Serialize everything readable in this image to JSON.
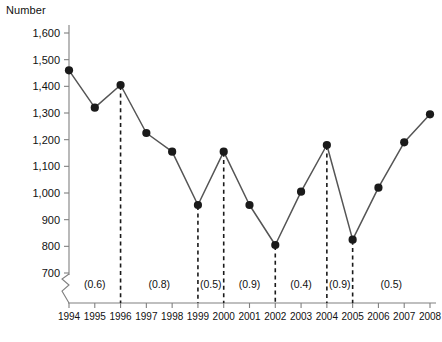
{
  "chart_data": {
    "type": "line",
    "title": "",
    "ylabel": "Number",
    "xlabel": "",
    "grid": false,
    "legend": null,
    "ylim": [
      700,
      1600
    ],
    "y_axis_break": true,
    "yticks": [
      "700",
      "800",
      "900",
      "1,000",
      "1,100",
      "1,200",
      "1,300",
      "1,400",
      "1,500",
      "1,600"
    ],
    "ytick_values": [
      700,
      800,
      900,
      1000,
      1100,
      1200,
      1300,
      1400,
      1500,
      1600
    ],
    "categories": [
      "1994",
      "1995",
      "1996",
      "1997",
      "1998",
      "1999",
      "2000",
      "2001",
      "2002",
      "2003",
      "2004",
      "2005",
      "2006",
      "2007",
      "2008"
    ],
    "x": [
      1994,
      1995,
      1996,
      1997,
      1998,
      1999,
      2000,
      2001,
      2002,
      2003,
      2004,
      2005,
      2006,
      2007,
      2008
    ],
    "values": [
      1460,
      1320,
      1405,
      1225,
      1155,
      955,
      1155,
      955,
      805,
      1005,
      1180,
      825,
      1020,
      1190,
      1295
    ],
    "series": [
      {
        "name": "Number",
        "values": [
          1460,
          1320,
          1405,
          1225,
          1155,
          955,
          1155,
          955,
          805,
          1005,
          1180,
          825,
          1020,
          1190,
          1295
        ]
      }
    ],
    "annotations": [
      {
        "label": "(0.6)",
        "between": [
          "1994",
          "1996"
        ],
        "center_x": 1995.0
      },
      {
        "label": "(0.8)",
        "between": [
          "1996",
          "1999"
        ],
        "center_x": 1997.5
      },
      {
        "label": "(0.5)",
        "between": [
          "1999",
          "2000"
        ],
        "center_x": 1999.5
      },
      {
        "label": "(0.9)",
        "between": [
          "2000",
          "2002"
        ],
        "center_x": 2001.0
      },
      {
        "label": "(0.4)",
        "between": [
          "2002",
          "2004"
        ],
        "center_x": 2003.0
      },
      {
        "label": "(0.9)",
        "between": [
          "2004",
          "2005"
        ],
        "center_x": 2004.5
      },
      {
        "label": "(0.5)",
        "between": [
          "2005",
          "2008"
        ],
        "center_x": 2006.5
      }
    ],
    "dashed_verticals": [
      1996,
      1999,
      2000,
      2002,
      2004,
      2005
    ],
    "colors": {
      "line": "#555555",
      "marker": "#1a1a1a",
      "axis": "#808080",
      "dashed": "#1a1a1a",
      "text": "#111111",
      "background": "#ffffff"
    }
  }
}
